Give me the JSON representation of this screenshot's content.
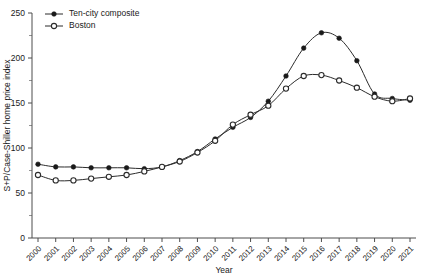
{
  "chart_data": {
    "type": "line",
    "title": "",
    "xlabel": "Year",
    "ylabel": "S+P/Case-Shiller home price index",
    "xlim": [
      2000,
      2021
    ],
    "ylim": [
      0,
      250
    ],
    "ytick_values": [
      0,
      50,
      100,
      150,
      200,
      250
    ],
    "ytick_labels": [
      "0",
      "50",
      "100",
      "150",
      "200",
      "250"
    ],
    "yminor_values": [
      25,
      75,
      125,
      175,
      225
    ],
    "grid": false,
    "legend_position": "top-left-inside",
    "categories": [
      2000,
      2001,
      2002,
      2003,
      2004,
      2005,
      2006,
      2007,
      2008,
      2009,
      2010,
      2011,
      2012,
      2013,
      2014,
      2015,
      2016,
      2017,
      2018,
      2019,
      2020,
      2021
    ],
    "xtick_labels": [
      "2000",
      "2001",
      "2002",
      "2003",
      "2004",
      "2005",
      "2006",
      "2007",
      "2008",
      "2009",
      "2010",
      "2011",
      "2012",
      "2013",
      "2014",
      "2015",
      "2016",
      "2017",
      "2018",
      "2019",
      "2020",
      "2021"
    ],
    "series": [
      {
        "name": "Ten-city composite",
        "marker": "filled-circle",
        "values": [
          82,
          79,
          79,
          78,
          78,
          78,
          77,
          79,
          86,
          96,
          110,
          123,
          134,
          152,
          180,
          211,
          228,
          222,
          197,
          160,
          155,
          153
        ]
      },
      {
        "name": "Boston",
        "marker": "open-circle",
        "values": [
          70,
          64,
          64,
          66,
          68,
          70,
          74,
          79,
          85,
          95,
          108,
          126,
          137,
          147,
          166,
          180,
          181,
          175,
          167,
          157,
          152,
          155
        ]
      }
    ]
  },
  "legend": {
    "items": [
      {
        "label": "Ten-city composite"
      },
      {
        "label": "Boston"
      }
    ]
  }
}
